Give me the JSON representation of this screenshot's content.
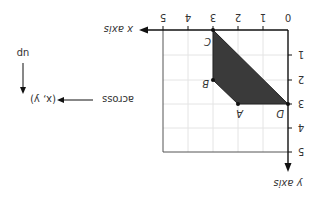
{
  "diagram": {
    "orientation": "rotated 180 degrees",
    "x_axis": {
      "label": "x axis",
      "ticks": [
        "0",
        "1",
        "2",
        "3",
        "4",
        "5"
      ]
    },
    "y_axis": {
      "label": "y axis",
      "ticks": [
        "1",
        "2",
        "3",
        "4",
        "5"
      ]
    },
    "points": [
      {
        "name": "A",
        "x": 2,
        "y": 3
      },
      {
        "name": "B",
        "x": 3,
        "y": 2
      },
      {
        "name": "C",
        "x": 3,
        "y": 0
      },
      {
        "name": "D",
        "x": 0,
        "y": 3
      }
    ],
    "shape_fill": "#3a3a3a",
    "legend": {
      "coord": "(x, y)",
      "across": "across",
      "up": "up"
    }
  }
}
